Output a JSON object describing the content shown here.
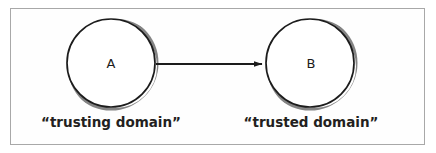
{
  "figure": {
    "border_color": "#a8a8a8",
    "background": "#ffffff",
    "stroke_color": "#1c1c1c",
    "shadow_color": "#6d6d6d"
  },
  "nodes": [
    {
      "id": "A",
      "label": "A",
      "caption": "“trusting domain”",
      "cx": 111,
      "cy": 63,
      "r": 44
    },
    {
      "id": "B",
      "label": "B",
      "caption": "“trusted domain”",
      "cx": 310,
      "cy": 63,
      "r": 44
    }
  ],
  "edges": [
    {
      "id": "a-to-b",
      "from": "A",
      "to": "B",
      "label": "",
      "direction": "forward",
      "x1": 156,
      "y1": 64,
      "x2": 262,
      "y2": 64
    }
  ]
}
